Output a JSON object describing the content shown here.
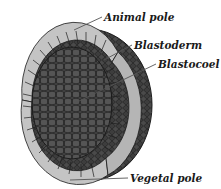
{
  "figure": {
    "labels": {
      "animal_pole": "Animal pole",
      "blastoderm": "Blastoderm",
      "blastocoel": "Blastocoel",
      "vegetal_pole": "Vegetal pole"
    }
  },
  "colors": {
    "background": "#ffffff",
    "outer_shell": "#3a3a3a",
    "cell_outline": "#1c1c1c",
    "blastoderm_cells": "#bdbdbd",
    "blastocoel_interior": "#4a4a4a",
    "leader_line": "#555555",
    "label_text": "#1a1a1a"
  }
}
